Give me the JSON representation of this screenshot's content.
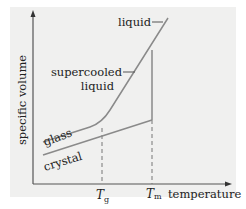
{
  "diagram": {
    "y_axis_label": "specific volume",
    "x_axis_label": "temperature",
    "labels": {
      "liquid": "liquid",
      "supercooled_line1": "supercooled",
      "supercooled_line2": "liquid",
      "glass": "glass",
      "crystal": "crystal"
    },
    "ticks": {
      "tg_main": "T",
      "tg_sub": "g",
      "tm_main": "T",
      "tm_sub": "m"
    },
    "colors": {
      "background": "#f0f0ef",
      "curve": "#8a8a8a",
      "axis": "#555555",
      "text": "#222222"
    }
  }
}
